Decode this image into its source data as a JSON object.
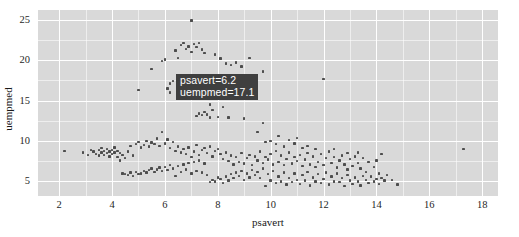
{
  "chart_data": {
    "type": "scatter",
    "title": "",
    "xlabel": "psavert",
    "ylabel": "uempmed",
    "xlim": [
      1.2,
      18.6
    ],
    "ylim": [
      3.2,
      26.2
    ],
    "xticks": [
      2,
      4,
      6,
      8,
      10,
      12,
      14,
      16,
      18
    ],
    "yticks": [
      5,
      10,
      15,
      20,
      25
    ],
    "grid": true,
    "legend": "none",
    "point_color": "#4d4d4d",
    "panel_color": "#d9d9d9",
    "gridline_color": "#ffffff",
    "series": [
      {
        "name": "economics",
        "points": [
          [
            2.2,
            8.8
          ],
          [
            2.9,
            8.6
          ],
          [
            3.1,
            8.3
          ],
          [
            3.2,
            8.9
          ],
          [
            3.3,
            8.7
          ],
          [
            3.4,
            8.4
          ],
          [
            3.5,
            8.9
          ],
          [
            3.5,
            8.2
          ],
          [
            3.6,
            9.1
          ],
          [
            3.6,
            8.6
          ],
          [
            3.7,
            8.8
          ],
          [
            3.7,
            8.3
          ],
          [
            3.8,
            9.0
          ],
          [
            3.8,
            8.5
          ],
          [
            3.9,
            8.7
          ],
          [
            3.9,
            8.1
          ],
          [
            4.0,
            8.9
          ],
          [
            4.0,
            8.4
          ],
          [
            4.1,
            9.2
          ],
          [
            4.1,
            8.6
          ],
          [
            4.2,
            8.0
          ],
          [
            4.2,
            8.8
          ],
          [
            4.3,
            7.6
          ],
          [
            4.3,
            8.5
          ],
          [
            4.4,
            6.0
          ],
          [
            4.4,
            8.3
          ],
          [
            4.5,
            5.9
          ],
          [
            4.5,
            7.9
          ],
          [
            4.6,
            5.8
          ],
          [
            4.6,
            8.7
          ],
          [
            4.7,
            6.1
          ],
          [
            4.7,
            9.4
          ],
          [
            4.8,
            5.7
          ],
          [
            4.8,
            8.2
          ],
          [
            4.9,
            6.2
          ],
          [
            4.9,
            9.6
          ],
          [
            5.0,
            5.9
          ],
          [
            5.0,
            9.9
          ],
          [
            5.0,
            16.3
          ],
          [
            5.1,
            6.0
          ],
          [
            5.1,
            9.2
          ],
          [
            5.2,
            6.3
          ],
          [
            5.2,
            9.5
          ],
          [
            5.3,
            6.1
          ],
          [
            5.3,
            10.0
          ],
          [
            5.4,
            6.4
          ],
          [
            5.4,
            9.3
          ],
          [
            5.5,
            6.6
          ],
          [
            5.5,
            9.8
          ],
          [
            5.5,
            18.9
          ],
          [
            5.6,
            6.2
          ],
          [
            5.6,
            9.6
          ],
          [
            5.7,
            6.5
          ],
          [
            5.7,
            10.3
          ],
          [
            5.8,
            6.7
          ],
          [
            5.8,
            9.4
          ],
          [
            5.9,
            6.3
          ],
          [
            5.9,
            11.1
          ],
          [
            5.9,
            19.9
          ],
          [
            6.0,
            6.8
          ],
          [
            6.0,
            9.7
          ],
          [
            6.0,
            20.1
          ],
          [
            6.1,
            6.4
          ],
          [
            6.1,
            10.2
          ],
          [
            6.1,
            16.5
          ],
          [
            6.2,
            7.0
          ],
          [
            6.2,
            9.1
          ],
          [
            6.2,
            17.1
          ],
          [
            6.2,
            16.0
          ],
          [
            6.3,
            6.6
          ],
          [
            6.3,
            9.9
          ],
          [
            6.3,
            17.4
          ],
          [
            6.4,
            5.7
          ],
          [
            6.4,
            8.8
          ],
          [
            6.4,
            21.2
          ],
          [
            6.5,
            6.9
          ],
          [
            6.5,
            9.3
          ],
          [
            6.5,
            20.3
          ],
          [
            6.6,
            6.2
          ],
          [
            6.6,
            8.6
          ],
          [
            6.6,
            21.9
          ],
          [
            6.7,
            7.1
          ],
          [
            6.7,
            9.0
          ],
          [
            6.7,
            22.1
          ],
          [
            6.8,
            6.5
          ],
          [
            6.8,
            8.4
          ],
          [
            6.8,
            21.4
          ],
          [
            6.9,
            7.3
          ],
          [
            6.9,
            9.2
          ],
          [
            6.9,
            21.7
          ],
          [
            7.0,
            6.0
          ],
          [
            7.0,
            8.0
          ],
          [
            7.0,
            24.9
          ],
          [
            7.0,
            21.0
          ],
          [
            7.1,
            7.4
          ],
          [
            7.1,
            8.7
          ],
          [
            7.1,
            22.0
          ],
          [
            7.2,
            6.3
          ],
          [
            7.2,
            9.5
          ],
          [
            7.2,
            21.6
          ],
          [
            7.2,
            13.1
          ],
          [
            7.3,
            7.6
          ],
          [
            7.3,
            8.3
          ],
          [
            7.3,
            22.1
          ],
          [
            7.3,
            13.4
          ],
          [
            7.4,
            6.1
          ],
          [
            7.4,
            8.9
          ],
          [
            7.4,
            21.3
          ],
          [
            7.4,
            13.2
          ],
          [
            7.5,
            7.2
          ],
          [
            7.5,
            9.1
          ],
          [
            7.5,
            20.9
          ],
          [
            7.5,
            13.6
          ],
          [
            7.6,
            5.8
          ],
          [
            7.6,
            8.5
          ],
          [
            7.6,
            15.6
          ],
          [
            7.6,
            13.3
          ],
          [
            7.7,
            4.9
          ],
          [
            7.7,
            9.3
          ],
          [
            7.7,
            14.5
          ],
          [
            7.7,
            12.9
          ],
          [
            7.8,
            5.2
          ],
          [
            7.8,
            8.1
          ],
          [
            7.8,
            13.8
          ],
          [
            7.9,
            5.0
          ],
          [
            7.9,
            8.8
          ],
          [
            7.9,
            20.7
          ],
          [
            8.0,
            5.5
          ],
          [
            8.0,
            9.0
          ],
          [
            8.0,
            13.0
          ],
          [
            8.1,
            5.3
          ],
          [
            8.1,
            8.4
          ],
          [
            8.1,
            20.2
          ],
          [
            8.2,
            4.8
          ],
          [
            8.2,
            7.8
          ],
          [
            8.2,
            14.2
          ],
          [
            8.3,
            5.6
          ],
          [
            8.3,
            8.6
          ],
          [
            8.3,
            19.6
          ],
          [
            8.4,
            5.1
          ],
          [
            8.4,
            7.5
          ],
          [
            8.4,
            12.9
          ],
          [
            8.5,
            5.9
          ],
          [
            8.5,
            8.2
          ],
          [
            8.5,
            19.4
          ],
          [
            8.6,
            5.4
          ],
          [
            8.6,
            7.1
          ],
          [
            8.7,
            6.1
          ],
          [
            8.7,
            8.0
          ],
          [
            8.7,
            19.7
          ],
          [
            8.8,
            5.7
          ],
          [
            8.8,
            7.4
          ],
          [
            8.9,
            6.3
          ],
          [
            8.9,
            8.5
          ],
          [
            8.9,
            19.2
          ],
          [
            9.0,
            5.2
          ],
          [
            9.0,
            7.2
          ],
          [
            9.0,
            12.8
          ],
          [
            9.1,
            6.0
          ],
          [
            9.1,
            7.9
          ],
          [
            9.2,
            5.5
          ],
          [
            9.2,
            8.3
          ],
          [
            9.2,
            20.3
          ],
          [
            9.3,
            6.4
          ],
          [
            9.3,
            7.0
          ],
          [
            9.4,
            5.8
          ],
          [
            9.4,
            8.1
          ],
          [
            9.5,
            6.2
          ],
          [
            9.5,
            7.6
          ],
          [
            9.5,
            11.1
          ],
          [
            9.6,
            5.4
          ],
          [
            9.6,
            8.7
          ],
          [
            9.7,
            6.6
          ],
          [
            9.7,
            7.3
          ],
          [
            9.7,
            12.2
          ],
          [
            9.7,
            18.6
          ],
          [
            9.8,
            4.4
          ],
          [
            9.8,
            8.0
          ],
          [
            9.8,
            9.9
          ],
          [
            9.9,
            5.9
          ],
          [
            9.9,
            7.7
          ],
          [
            10.0,
            5.1
          ],
          [
            10.0,
            8.4
          ],
          [
            10.0,
            10.0
          ],
          [
            10.1,
            6.3
          ],
          [
            10.1,
            7.1
          ],
          [
            10.2,
            4.8
          ],
          [
            10.2,
            8.8
          ],
          [
            10.2,
            9.6
          ],
          [
            10.3,
            5.6
          ],
          [
            10.3,
            7.4
          ],
          [
            10.3,
            10.6
          ],
          [
            10.4,
            5.0
          ],
          [
            10.4,
            8.2
          ],
          [
            10.5,
            6.1
          ],
          [
            10.5,
            7.0
          ],
          [
            10.5,
            9.3
          ],
          [
            10.6,
            4.6
          ],
          [
            10.6,
            7.8
          ],
          [
            10.7,
            5.4
          ],
          [
            10.7,
            8.6
          ],
          [
            10.7,
            10.1
          ],
          [
            10.8,
            4.9
          ],
          [
            10.8,
            7.2
          ],
          [
            10.9,
            6.0
          ],
          [
            10.9,
            8.0
          ],
          [
            10.9,
            9.7
          ],
          [
            11.0,
            5.2
          ],
          [
            11.0,
            7.5
          ],
          [
            11.0,
            10.4
          ],
          [
            11.1,
            4.7
          ],
          [
            11.1,
            8.3
          ],
          [
            11.2,
            5.8
          ],
          [
            11.2,
            6.9
          ],
          [
            11.2,
            9.1
          ],
          [
            11.3,
            5.1
          ],
          [
            11.3,
            7.7
          ],
          [
            11.4,
            6.2
          ],
          [
            11.4,
            8.5
          ],
          [
            11.4,
            9.4
          ],
          [
            11.5,
            4.5
          ],
          [
            11.5,
            7.1
          ],
          [
            11.6,
            5.5
          ],
          [
            11.6,
            8.1
          ],
          [
            11.7,
            5.0
          ],
          [
            11.7,
            6.8
          ],
          [
            11.7,
            9.0
          ],
          [
            11.8,
            5.9
          ],
          [
            11.8,
            7.4
          ],
          [
            11.9,
            4.8
          ],
          [
            11.9,
            8.4
          ],
          [
            12.0,
            5.3
          ],
          [
            12.0,
            7.0
          ],
          [
            12.0,
            17.7
          ],
          [
            12.1,
            6.1
          ],
          [
            12.1,
            7.9
          ],
          [
            12.2,
            4.6
          ],
          [
            12.2,
            8.7
          ],
          [
            12.3,
            5.6
          ],
          [
            12.3,
            7.3
          ],
          [
            12.4,
            5.0
          ],
          [
            12.4,
            8.0
          ],
          [
            12.4,
            9.0
          ],
          [
            12.5,
            6.0
          ],
          [
            12.5,
            6.7
          ],
          [
            12.6,
            4.9
          ],
          [
            12.6,
            7.6
          ],
          [
            12.7,
            5.4
          ],
          [
            12.7,
            8.2
          ],
          [
            12.8,
            4.4
          ],
          [
            12.8,
            7.1
          ],
          [
            12.9,
            5.8
          ],
          [
            12.9,
            6.5
          ],
          [
            12.9,
            8.5
          ],
          [
            13.0,
            5.1
          ],
          [
            13.0,
            7.8
          ],
          [
            13.1,
            4.7
          ],
          [
            13.1,
            6.9
          ],
          [
            13.2,
            5.5
          ],
          [
            13.2,
            8.1
          ],
          [
            13.3,
            5.0
          ],
          [
            13.3,
            7.3
          ],
          [
            13.3,
            8.6
          ],
          [
            13.4,
            4.5
          ],
          [
            13.4,
            6.6
          ],
          [
            13.5,
            5.7
          ],
          [
            13.5,
            7.9
          ],
          [
            13.6,
            5.2
          ],
          [
            13.6,
            6.2
          ],
          [
            13.7,
            4.8
          ],
          [
            13.7,
            7.4
          ],
          [
            13.8,
            5.6
          ],
          [
            13.9,
            5.0
          ],
          [
            13.9,
            6.8
          ],
          [
            14.0,
            5.3
          ],
          [
            14.0,
            7.6
          ],
          [
            14.1,
            4.7
          ],
          [
            14.1,
            6.0
          ],
          [
            14.2,
            5.4
          ],
          [
            14.2,
            8.4
          ],
          [
            14.3,
            5.1
          ],
          [
            14.4,
            5.8
          ],
          [
            14.6,
            5.2
          ],
          [
            14.8,
            4.6
          ],
          [
            17.3,
            9.0
          ]
        ]
      }
    ]
  },
  "tooltip": {
    "line1": "psavert=6.2",
    "line2": "uempmed=17.1",
    "background": "#3f3f3f",
    "text_color": "#ffffff"
  },
  "axes": {
    "x_title": "psavert",
    "y_title": "uempmed",
    "x_tick_labels": [
      "2",
      "4",
      "6",
      "8",
      "10",
      "12",
      "14",
      "16",
      "18"
    ],
    "y_tick_labels": [
      "5",
      "10",
      "15",
      "20",
      "25"
    ]
  }
}
